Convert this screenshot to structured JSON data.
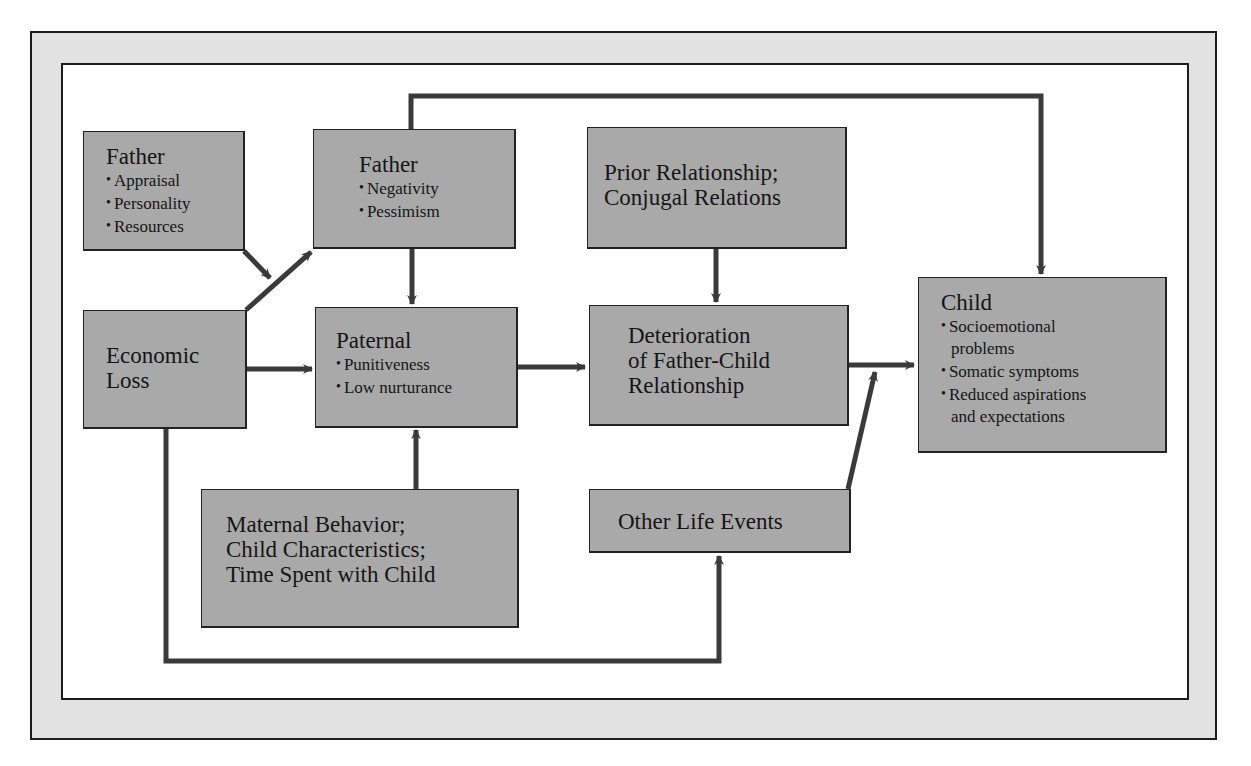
{
  "diagram": {
    "type": "flowchart",
    "nodes": {
      "father_traits": {
        "title": "Father",
        "items": [
          "Appraisal",
          "Personality",
          "Resources"
        ]
      },
      "father_outlook": {
        "title": "Father",
        "items": [
          "Negativity",
          "Pessimism"
        ]
      },
      "prior_relationship": {
        "lines": [
          "Prior Relationship;",
          "Conjugal Relations"
        ]
      },
      "economic_loss": {
        "lines": [
          "Economic",
          "Loss"
        ]
      },
      "paternal": {
        "title": "Paternal",
        "items": [
          "Punitiveness",
          "Low nurturance"
        ]
      },
      "deterioration": {
        "lines": [
          "Deterioration",
          "of Father-Child",
          "Relationship"
        ]
      },
      "child": {
        "title": "Child",
        "items": [
          "Socioemotional",
          "problems",
          "Somatic symptoms",
          "Reduced aspirations",
          "and expectations"
        ]
      },
      "maternal": {
        "lines": [
          "Maternal Behavior;",
          "Child Characteristics;",
          "Time Spent with Child"
        ]
      },
      "other_life_events": {
        "lines": [
          "Other Life Events"
        ]
      }
    },
    "edges": [
      {
        "from": "father_traits",
        "to": "economic_loss->father_outlook junction"
      },
      {
        "from": "economic_loss",
        "to": "father_outlook"
      },
      {
        "from": "economic_loss",
        "to": "paternal"
      },
      {
        "from": "economic_loss",
        "to": "other_life_events"
      },
      {
        "from": "father_outlook",
        "to": "paternal"
      },
      {
        "from": "father_outlook",
        "to": "child"
      },
      {
        "from": "maternal",
        "to": "paternal"
      },
      {
        "from": "paternal",
        "to": "deterioration"
      },
      {
        "from": "prior_relationship",
        "to": "deterioration"
      },
      {
        "from": "deterioration",
        "to": "child"
      },
      {
        "from": "other_life_events",
        "to": "deterioration->child"
      }
    ],
    "colors": {
      "box_fill": "#a9a9a9",
      "arrow": "#3a3a3a",
      "frame_fill": "#e2e2e2",
      "border": "#1c1c1c"
    }
  }
}
